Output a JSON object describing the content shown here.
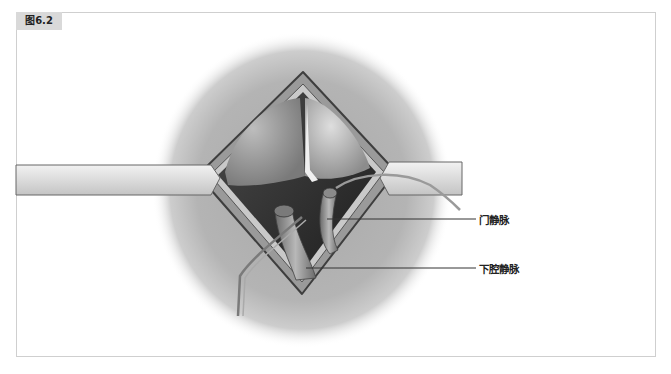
{
  "figure": {
    "tag": "图6.2",
    "labels": [
      {
        "text": "门静脉",
        "name": "portal-vein"
      },
      {
        "text": "下腔静脉",
        "name": "inferior-vena-cava"
      }
    ]
  },
  "colors": {
    "frame_border": "#cfcfcf",
    "tag_background": "#d9d9d9",
    "label_text": "#222222",
    "leader_line": "#333333"
  }
}
